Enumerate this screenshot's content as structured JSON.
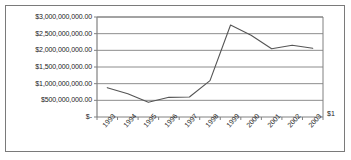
{
  "chart_data": {
    "type": "line",
    "title": "",
    "xlabel": "",
    "ylabel": "",
    "categories": [
      "1993",
      "1994",
      "1995",
      "1996",
      "1997",
      "1998",
      "1999",
      "2000",
      "2001",
      "2002",
      "2003"
    ],
    "values": [
      880000000,
      700000000,
      440000000,
      590000000,
      600000000,
      1090000000,
      2760000000,
      2450000000,
      2050000000,
      2150000000,
      2060000000
    ],
    "series": [
      {
        "name": "",
        "values": [
          880000000,
          700000000,
          440000000,
          590000000,
          600000000,
          1090000000,
          2760000000,
          2450000000,
          2050000000,
          2150000000,
          2060000000
        ]
      }
    ],
    "ylim": [
      0,
      3000000000
    ],
    "ytick_values": [
      0,
      500000000,
      1000000000,
      1500000000,
      2000000000,
      2500000000,
      3000000000
    ],
    "ytick_labels": [
      "$-",
      "$500,000,000.00",
      "$1,000,000,000.00",
      "$1,500,000,000.00",
      "$2,000,000,000.00",
      "$2,500,000,000.00",
      "$3,000,000,000.00"
    ],
    "grid": true,
    "grid_axis": "y",
    "legend": false,
    "legend_position": "none",
    "line_color": "#555555",
    "grid_color": "#808080",
    "axis_color": "#808080",
    "background_color": "#ffffff",
    "border_color": "#7a7a7a",
    "corner_label": "$1",
    "annotations": []
  }
}
